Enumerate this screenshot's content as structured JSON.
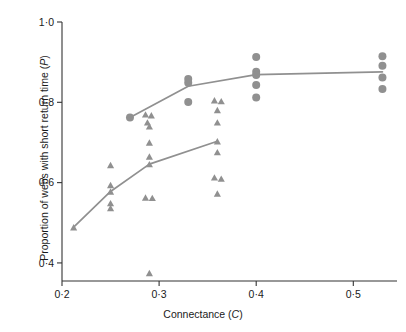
{
  "chart_data": {
    "type": "scatter",
    "title": "",
    "xlabel": "Connectance (C)",
    "ylabel": "Proportion of webs with short return time (P)",
    "xlabel_text": "Connectance (",
    "xlabel_var": "C",
    "xlabel_tail": ")",
    "ylabel_text": "Proportion of webs with short return time (",
    "ylabel_var": "P",
    "ylabel_tail": ")",
    "decimal_separator": "·",
    "xlim": [
      0.2,
      0.545
    ],
    "ylim": [
      0.355,
      1.0
    ],
    "xticks": [
      0.2,
      0.3,
      0.4,
      0.5
    ],
    "xtick_labels": [
      "0·2",
      "0·3",
      "0·4",
      "0·5"
    ],
    "yticks": [
      0.4,
      0.6,
      0.8,
      1.0
    ],
    "ytick_labels": [
      "0·4",
      "0·6",
      "0·8",
      "1·0"
    ],
    "grid": false,
    "legend": null,
    "marker_color": "#909090",
    "line_color": "#909090",
    "axis_color": "#333333",
    "series": [
      {
        "name": "circles",
        "marker": "circle",
        "marker_size": 7,
        "color": "#909090",
        "points": [
          {
            "x": 0.27,
            "y": 0.762
          },
          {
            "x": 0.33,
            "y": 0.858
          },
          {
            "x": 0.33,
            "y": 0.849
          },
          {
            "x": 0.33,
            "y": 0.801
          },
          {
            "x": 0.4,
            "y": 0.913
          },
          {
            "x": 0.4,
            "y": 0.876
          },
          {
            "x": 0.4,
            "y": 0.868
          },
          {
            "x": 0.4,
            "y": 0.843
          },
          {
            "x": 0.4,
            "y": 0.812
          },
          {
            "x": 0.53,
            "y": 0.915
          },
          {
            "x": 0.53,
            "y": 0.891
          },
          {
            "x": 0.53,
            "y": 0.862
          },
          {
            "x": 0.53,
            "y": 0.833
          }
        ],
        "fit_line": [
          {
            "x": 0.27,
            "y": 0.762
          },
          {
            "x": 0.33,
            "y": 0.84
          },
          {
            "x": 0.4,
            "y": 0.869
          },
          {
            "x": 0.53,
            "y": 0.876
          }
        ]
      },
      {
        "name": "triangles",
        "marker": "triangle",
        "marker_size": 7,
        "color": "#909090",
        "points": [
          {
            "x": 0.212,
            "y": 0.489
          },
          {
            "x": 0.25,
            "y": 0.644
          },
          {
            "x": 0.25,
            "y": 0.594
          },
          {
            "x": 0.25,
            "y": 0.578
          },
          {
            "x": 0.25,
            "y": 0.549
          },
          {
            "x": 0.25,
            "y": 0.537
          },
          {
            "x": 0.286,
            "y": 0.77
          },
          {
            "x": 0.292,
            "y": 0.768
          },
          {
            "x": 0.288,
            "y": 0.75
          },
          {
            "x": 0.29,
            "y": 0.74
          },
          {
            "x": 0.29,
            "y": 0.7
          },
          {
            "x": 0.29,
            "y": 0.665
          },
          {
            "x": 0.29,
            "y": 0.646
          },
          {
            "x": 0.286,
            "y": 0.563
          },
          {
            "x": 0.293,
            "y": 0.562
          },
          {
            "x": 0.29,
            "y": 0.375
          },
          {
            "x": 0.357,
            "y": 0.805
          },
          {
            "x": 0.364,
            "y": 0.803
          },
          {
            "x": 0.36,
            "y": 0.781
          },
          {
            "x": 0.36,
            "y": 0.75
          },
          {
            "x": 0.36,
            "y": 0.703
          },
          {
            "x": 0.36,
            "y": 0.676
          },
          {
            "x": 0.357,
            "y": 0.613
          },
          {
            "x": 0.364,
            "y": 0.61
          },
          {
            "x": 0.36,
            "y": 0.573
          }
        ],
        "fit_line": [
          {
            "x": 0.212,
            "y": 0.489
          },
          {
            "x": 0.25,
            "y": 0.578
          },
          {
            "x": 0.29,
            "y": 0.646
          },
          {
            "x": 0.36,
            "y": 0.703
          }
        ]
      }
    ]
  }
}
